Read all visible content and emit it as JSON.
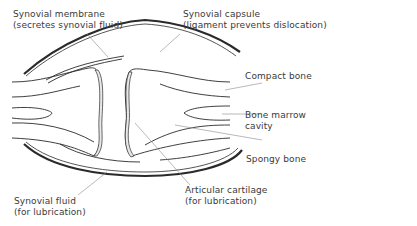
{
  "diagram": {
    "type": "anatomical-diagram",
    "labels": {
      "synovial_membrane": {
        "line1": "Synovial membrane",
        "line2": "(secretes synovial fluid)"
      },
      "synovial_capsule": {
        "line1": "Synovial capsule",
        "line2": "(ligament prevents dislocation)"
      },
      "compact_bone": {
        "line1": "Compact bone"
      },
      "bone_marrow_cavity": {
        "line1": "Bone marrow",
        "line2": "cavity"
      },
      "spongy_bone": {
        "line1": "Spongy bone"
      },
      "synovial_fluid": {
        "line1": "Synovial fluid",
        "line2": "(for lubrication)"
      },
      "articular_cartilage": {
        "line1": "Articular cartilage",
        "line2": "(for lubrication)"
      }
    },
    "colors": {
      "line": "#2a2a2a",
      "leader": "#8a8a8a",
      "text": "#3a3a3a",
      "background": "#ffffff"
    }
  }
}
